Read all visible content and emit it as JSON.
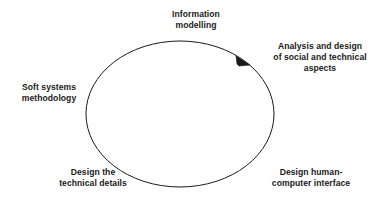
{
  "diagram": {
    "type": "cycle",
    "direction": "clockwise",
    "background_color": "#ffffff",
    "stroke_color": "#1a1a1a",
    "text_color": "#1a1a1a",
    "shape": {
      "name": "ellipse",
      "center_x": 180,
      "center_y": 114,
      "radius_x": 94,
      "radius_y": 73,
      "stroke_width": 1
    },
    "arrowhead": {
      "name": "clockwise-arrowhead",
      "x": 244,
      "y": 62,
      "points_to": "Analysis and design of social and technical aspects"
    },
    "nodes": [
      {
        "id": "information-modelling",
        "label": "Information\nmodelling",
        "position": "top"
      },
      {
        "id": "analysis-design",
        "label": "Analysis and design\nof social and technical\naspects",
        "position": "upper-right"
      },
      {
        "id": "soft-systems",
        "label": "Soft systems\nmethodology",
        "position": "left"
      },
      {
        "id": "design-technical",
        "label": "Design the\ntechnical details",
        "position": "bottom-left"
      },
      {
        "id": "design-hci",
        "label": "Design human-\ncomputer interface",
        "position": "bottom-right"
      }
    ]
  }
}
